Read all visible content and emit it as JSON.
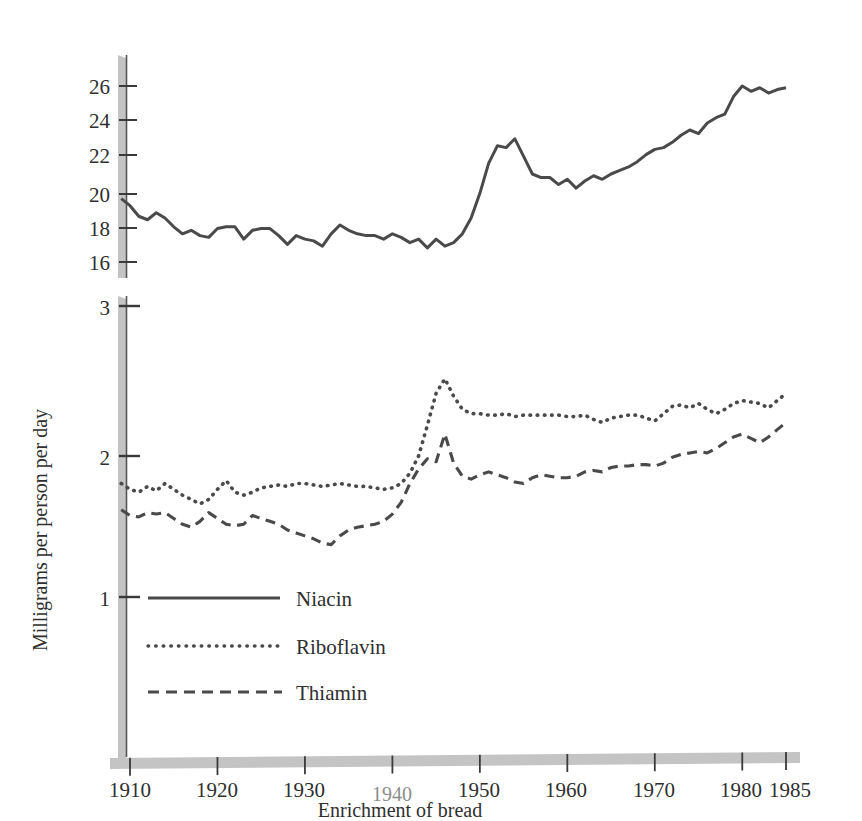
{
  "chart_data": {
    "type": "line",
    "title": "",
    "xlabel": "Enrichment of bread",
    "ylabel": "Milligrams per person per day",
    "grid": false,
    "legend_position": "inside-lower-left",
    "xlim": [
      1909,
      1985
    ],
    "x_ticks": [
      1910,
      1920,
      1930,
      1940,
      1950,
      1960,
      1970,
      1980,
      1985
    ],
    "x_tick_labels": [
      "1910",
      "1920",
      "1930",
      "1940",
      "1950",
      "1960",
      "1970",
      "1980",
      "1985"
    ],
    "highlighted_x_tick": "1940",
    "annotation": "Enrichment of bread",
    "panels": [
      {
        "name": "upper-panel",
        "ylim": [
          15.2,
          27.2
        ],
        "y_ticks": [
          16,
          18,
          20,
          22,
          24,
          26
        ],
        "y_tick_labels": [
          "16",
          "18",
          "20",
          "22",
          "24",
          "26"
        ]
      },
      {
        "name": "lower-panel",
        "ylim": [
          0.25,
          3.1
        ],
        "y_ticks": [
          1,
          2,
          3
        ],
        "y_tick_labels": [
          "1",
          "2",
          "3"
        ]
      }
    ],
    "series": [
      {
        "name": "Niacin",
        "panel": "upper-panel",
        "style": "solid",
        "color": "#4a4a4a",
        "x": [
          1909,
          1910,
          1911,
          1912,
          1913,
          1914,
          1915,
          1916,
          1917,
          1918,
          1919,
          1920,
          1921,
          1922,
          1923,
          1924,
          1925,
          1926,
          1927,
          1928,
          1929,
          1930,
          1931,
          1932,
          1933,
          1934,
          1935,
          1936,
          1937,
          1938,
          1939,
          1940,
          1941,
          1942,
          1943,
          1944,
          1945,
          1946,
          1947,
          1948,
          1949,
          1950,
          1951,
          1952,
          1953,
          1954,
          1955,
          1956,
          1957,
          1958,
          1959,
          1960,
          1961,
          1962,
          1963,
          1964,
          1965,
          1966,
          1967,
          1968,
          1969,
          1970,
          1971,
          1972,
          1973,
          1974,
          1975,
          1976,
          1977,
          1978,
          1979,
          1980,
          1981,
          1982,
          1983,
          1984,
          1985
        ],
        "values": [
          19.6,
          19.2,
          18.6,
          18.4,
          18.8,
          18.5,
          18.0,
          17.6,
          17.8,
          17.5,
          17.4,
          17.9,
          18.0,
          18.0,
          17.3,
          17.8,
          17.9,
          17.9,
          17.5,
          17.0,
          17.5,
          17.3,
          17.2,
          16.9,
          17.6,
          18.1,
          17.8,
          17.6,
          17.5,
          17.5,
          17.3,
          17.6,
          17.4,
          17.1,
          17.3,
          16.8,
          17.3,
          16.9,
          17.1,
          17.6,
          18.5,
          19.9,
          21.6,
          22.6,
          22.5,
          23.0,
          22.0,
          21.0,
          20.8,
          20.8,
          20.4,
          20.7,
          20.2,
          20.6,
          20.9,
          20.7,
          21.0,
          21.2,
          21.4,
          21.7,
          22.1,
          22.4,
          22.5,
          22.8,
          23.2,
          23.5,
          23.3,
          23.9,
          24.2,
          24.4,
          25.4,
          26.0,
          25.7,
          25.9,
          25.6,
          25.8,
          25.9
        ]
      },
      {
        "name": "Riboflavin",
        "panel": "lower-panel",
        "style": "dotted",
        "color": "#4a4a4a",
        "x": [
          1909,
          1910,
          1911,
          1912,
          1913,
          1914,
          1915,
          1916,
          1917,
          1918,
          1919,
          1920,
          1921,
          1922,
          1923,
          1924,
          1925,
          1926,
          1927,
          1928,
          1929,
          1930,
          1931,
          1932,
          1933,
          1934,
          1935,
          1936,
          1937,
          1938,
          1939,
          1940,
          1941,
          1942,
          1943,
          1944,
          1945,
          1946,
          1947,
          1948,
          1949,
          1950,
          1951,
          1952,
          1953,
          1954,
          1955,
          1956,
          1957,
          1958,
          1959,
          1960,
          1961,
          1962,
          1963,
          1964,
          1965,
          1966,
          1967,
          1968,
          1969,
          1970,
          1971,
          1972,
          1973,
          1974,
          1975,
          1976,
          1977,
          1978,
          1979,
          1980,
          1981,
          1982,
          1983,
          1984,
          1985
        ],
        "values": [
          1.78,
          1.74,
          1.72,
          1.76,
          1.73,
          1.78,
          1.74,
          1.7,
          1.67,
          1.64,
          1.67,
          1.74,
          1.8,
          1.72,
          1.7,
          1.72,
          1.75,
          1.76,
          1.77,
          1.76,
          1.78,
          1.78,
          1.77,
          1.76,
          1.77,
          1.78,
          1.77,
          1.76,
          1.76,
          1.75,
          1.74,
          1.75,
          1.78,
          1.85,
          1.97,
          2.18,
          2.4,
          2.5,
          2.38,
          2.29,
          2.26,
          2.26,
          2.25,
          2.25,
          2.26,
          2.24,
          2.25,
          2.25,
          2.25,
          2.25,
          2.25,
          2.24,
          2.24,
          2.25,
          2.22,
          2.2,
          2.23,
          2.24,
          2.25,
          2.25,
          2.23,
          2.21,
          2.26,
          2.31,
          2.32,
          2.3,
          2.33,
          2.29,
          2.26,
          2.29,
          2.33,
          2.35,
          2.34,
          2.33,
          2.3,
          2.35,
          2.4
        ]
      },
      {
        "name": "Thiamin",
        "panel": "lower-panel",
        "style": "dashed",
        "color": "#4a4a4a",
        "x": [
          1909,
          1910,
          1911,
          1912,
          1913,
          1914,
          1915,
          1916,
          1917,
          1918,
          1919,
          1920,
          1921,
          1922,
          1923,
          1924,
          1925,
          1926,
          1927,
          1928,
          1929,
          1930,
          1931,
          1932,
          1933,
          1934,
          1935,
          1936,
          1937,
          1938,
          1939,
          1940,
          1941,
          1942,
          1943,
          1944,
          1945,
          1946,
          1947,
          1948,
          1949,
          1950,
          1951,
          1952,
          1953,
          1954,
          1955,
          1956,
          1957,
          1958,
          1959,
          1960,
          1961,
          1962,
          1963,
          1964,
          1965,
          1966,
          1967,
          1968,
          1969,
          1970,
          1971,
          1972,
          1973,
          1974,
          1975,
          1976,
          1977,
          1978,
          1979,
          1980,
          1981,
          1982,
          1983,
          1984,
          1985
        ],
        "values": [
          1.6,
          1.56,
          1.55,
          1.58,
          1.57,
          1.58,
          1.54,
          1.5,
          1.48,
          1.52,
          1.58,
          1.54,
          1.5,
          1.49,
          1.5,
          1.56,
          1.54,
          1.52,
          1.5,
          1.46,
          1.44,
          1.42,
          1.4,
          1.37,
          1.36,
          1.42,
          1.46,
          1.48,
          1.49,
          1.5,
          1.52,
          1.57,
          1.65,
          1.78,
          1.88,
          1.95,
          1.93,
          2.12,
          1.92,
          1.83,
          1.81,
          1.84,
          1.86,
          1.84,
          1.82,
          1.79,
          1.78,
          1.82,
          1.84,
          1.83,
          1.82,
          1.82,
          1.83,
          1.86,
          1.87,
          1.86,
          1.89,
          1.9,
          1.9,
          1.91,
          1.91,
          1.9,
          1.92,
          1.96,
          1.98,
          1.99,
          2.0,
          1.99,
          2.02,
          2.06,
          2.1,
          2.12,
          2.09,
          2.06,
          2.1,
          2.15,
          2.2
        ]
      }
    ],
    "legend": [
      {
        "label": "Niacin",
        "style": "solid"
      },
      {
        "label": "Riboflavin",
        "style": "dotted"
      },
      {
        "label": "Thiamin",
        "style": "dashed"
      }
    ]
  },
  "colors": {
    "line": "#4a4a4a",
    "axis_band": "#c9c9c9",
    "text": "#2f2f2f",
    "muted_text": "#8d8d8d",
    "background": "#ffffff"
  }
}
